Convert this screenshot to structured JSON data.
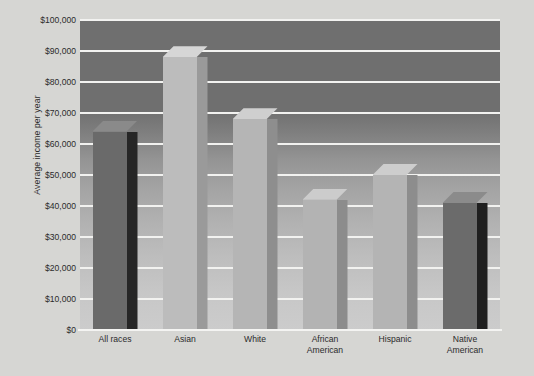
{
  "chart_data": {
    "type": "bar",
    "title": "",
    "xlabel": "",
    "ylabel": "Average income per year",
    "categories": [
      "All races",
      "Asian",
      "White",
      "African American",
      "Hispanic",
      "Native American"
    ],
    "values": [
      64000,
      88000,
      68000,
      42000,
      50000,
      41000
    ],
    "ylim": [
      0,
      100000
    ],
    "ytick_labels": [
      "$100,000",
      "$90,000",
      "$80,000",
      "$70,000",
      "$60,000",
      "$50,000",
      "$40,000",
      "$30,000",
      "$20,000",
      "$10,000",
      "$0"
    ],
    "ytick_values": [
      100000,
      90000,
      80000,
      70000,
      60000,
      50000,
      40000,
      30000,
      20000,
      10000,
      0
    ],
    "grid": true,
    "legend": "none",
    "bar_style": "3d",
    "bar_colors": [
      "#6a6a6a",
      "#bcbcbc",
      "#b5b5b5",
      "#b3b3b3",
      "#b4b4b4",
      "#6b6b6b"
    ],
    "bar_side_colors": [
      "#262626",
      "#9a9a9a",
      "#8e8e8e",
      "#8c8c8c",
      "#8d8d8d",
      "#1f1f1f"
    ],
    "bar_top_colors": [
      "#8a8a8a",
      "#d6d6d6",
      "#cfcfcf",
      "#cccccc",
      "#cdcdcd",
      "#8b8b8b"
    ],
    "colors": {
      "page_background": "#d6d6d3",
      "plot_background_top": "#6f6f6f",
      "plot_background_bottom": "#cccccc",
      "gridline": "#f2f2f0",
      "text": "#2b2b2b"
    }
  }
}
